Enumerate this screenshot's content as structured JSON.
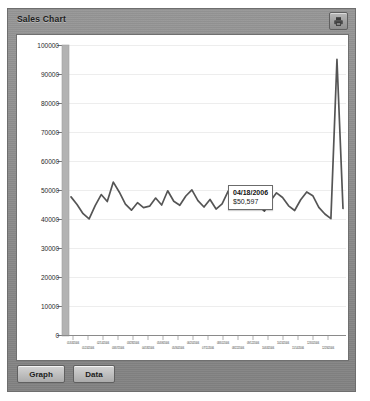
{
  "window": {
    "title": "Sales Chart",
    "header_button": {
      "name": "print-chart-button",
      "icon": "printer-icon"
    }
  },
  "footer": {
    "buttons": [
      {
        "id": "graph",
        "label": "Graph"
      },
      {
        "id": "data",
        "label": "Data"
      }
    ]
  },
  "tooltip": {
    "date": "04/18/2006",
    "value": "$50,597",
    "visible": true
  },
  "colors": {
    "panel": "#8c8c8c",
    "panel_border": "#6e6e6e",
    "plot_background": "#ffffff",
    "plot_border": "#707070",
    "gridline": "#ededed",
    "series_line": "#555555",
    "axis_band": "#b0b0b0",
    "tooltip_background": "#ffffff",
    "tooltip_border": "#6b6b6b",
    "marker": "#444444"
  },
  "chart_data": {
    "type": "line",
    "title": "Sales Chart",
    "xlabel": "",
    "ylabel": "",
    "ylim": [
      0,
      100000
    ],
    "ytick_labels": [
      "100000",
      "90000",
      "80000",
      "70000",
      "60000",
      "50000",
      "40000",
      "30000",
      "20000",
      "10000",
      "0"
    ],
    "ytick_values": [
      100000,
      90000,
      80000,
      70000,
      60000,
      50000,
      40000,
      30000,
      20000,
      10000,
      0
    ],
    "grid": true,
    "legend": false,
    "legend_position": "none",
    "annotations": [
      {
        "type": "tooltip",
        "x_label": "04/18/2006",
        "y_value": 50597,
        "value_label": "$50,597"
      }
    ],
    "x_tick_labels": [
      "01/03/2006",
      "01/24/2006",
      "02/14/2006",
      "03/07/2006",
      "03/28/2006",
      "04/18/2006",
      "05/09/2006",
      "05/30/2006",
      "06/20/2006",
      "07/11/2006",
      "08/01/2006",
      "08/22/2006",
      "09/12/2006",
      "10/03/2006",
      "10/24/2006",
      "11/14/2006",
      "12/05/2006",
      "12/26/2006"
    ],
    "series": [
      {
        "name": "Sales",
        "color": "#555555",
        "values": [
          47800,
          45200,
          42000,
          40200,
          44800,
          48600,
          46200,
          52900,
          49400,
          45300,
          43200,
          45800,
          44100,
          44600,
          47400,
          45000,
          49900,
          46300,
          44900,
          48100,
          50200,
          46500,
          44300,
          46900,
          43600,
          45400,
          49800,
          50597,
          46100,
          44400,
          47300,
          44800,
          42900,
          46400,
          49200,
          47600,
          44700,
          43100,
          46800,
          49500,
          48200,
          44200,
          41900,
          40300,
          95200,
          43800
        ]
      }
    ]
  }
}
